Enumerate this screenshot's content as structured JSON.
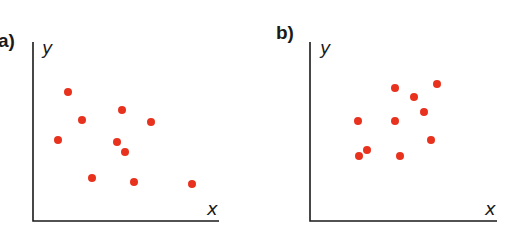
{
  "chart_data": [
    {
      "type": "scatter",
      "panel_label": "a)",
      "xlabel": "x",
      "ylabel": "y",
      "grid": false,
      "ticks": false,
      "point_color": "#e8321e",
      "description": "Negative correlation",
      "points_px": [
        [
          68,
          92
        ],
        [
          82,
          120
        ],
        [
          58,
          140
        ],
        [
          122,
          110
        ],
        [
          151,
          122
        ],
        [
          117,
          142
        ],
        [
          125,
          152
        ],
        [
          92,
          178
        ],
        [
          134,
          182
        ],
        [
          192,
          184
        ]
      ],
      "axes_px": {
        "origin": [
          33,
          221
        ],
        "x_end": 219,
        "y_top": 42,
        "ylabel_pos": [
          42,
          54
        ],
        "xlabel_pos": [
          207,
          215
        ]
      },
      "label_pos": [
        0,
        52
      ]
    },
    {
      "type": "scatter",
      "panel_label": "b)",
      "xlabel": "x",
      "ylabel": "y",
      "grid": false,
      "ticks": false,
      "point_color": "#e8321e",
      "description": "Positive correlation",
      "points_px": [
        [
          358,
          121
        ],
        [
          395,
          88
        ],
        [
          414,
          97
        ],
        [
          424,
          112
        ],
        [
          437,
          84
        ],
        [
          395,
          121
        ],
        [
          431,
          140
        ],
        [
          359,
          156
        ],
        [
          367,
          150
        ],
        [
          400,
          156
        ]
      ],
      "axes_px": {
        "origin": [
          310,
          221
        ],
        "x_end": 497,
        "y_top": 42,
        "ylabel_pos": [
          320,
          54
        ],
        "xlabel_pos": [
          485,
          215
        ]
      },
      "label_pos": [
        277,
        52
      ]
    }
  ]
}
